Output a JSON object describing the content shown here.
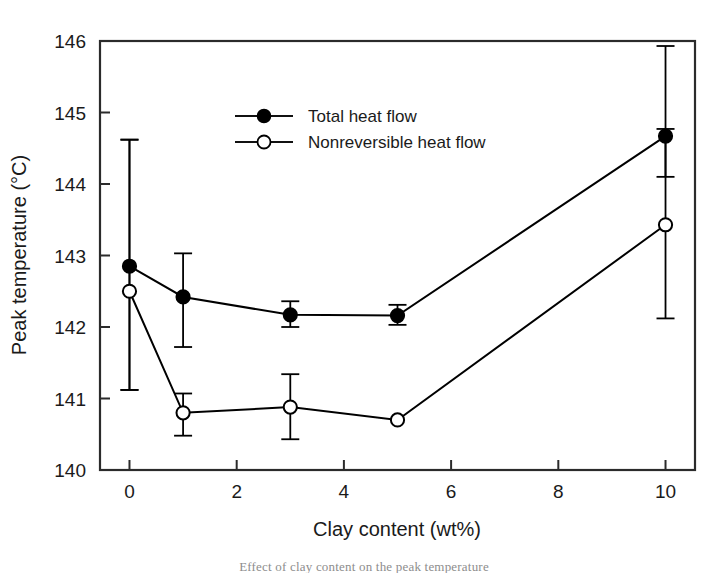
{
  "chart_data": {
    "type": "line",
    "title": "",
    "subtitle": "",
    "xlabel": "Clay content (wt%)",
    "ylabel": "Peak temperature (°C)",
    "xlim": [
      -0.55,
      10.55
    ],
    "ylim": [
      140,
      146
    ],
    "xticks": [
      0,
      2,
      4,
      6,
      8,
      10
    ],
    "xtick_labels": [
      "0",
      "2",
      "4",
      "6",
      "8",
      "10"
    ],
    "yticks": [
      140,
      141,
      142,
      143,
      144,
      145,
      146
    ],
    "ytick_labels": [
      "140",
      "141",
      "142",
      "143",
      "144",
      "145",
      "146"
    ],
    "grid": false,
    "legend_position": "upper-center-left",
    "x": [
      0,
      1,
      3,
      5,
      10
    ],
    "series": [
      {
        "name": "Total heat flow",
        "marker": "filled-circle",
        "color": "#000000",
        "values": [
          142.85,
          142.42,
          142.17,
          142.16,
          144.67
        ],
        "err_low": [
          141.12,
          141.72,
          142.0,
          142.03,
          144.1
        ],
        "err_high": [
          144.62,
          143.03,
          142.36,
          142.31,
          145.93
        ]
      },
      {
        "name": "Nonreversible heat flow",
        "marker": "open-circle",
        "color": "#000000",
        "values": [
          142.5,
          140.8,
          140.88,
          140.7,
          143.43
        ],
        "err_low": [
          141.12,
          140.48,
          140.43,
          140.7,
          142.12
        ],
        "err_high": [
          144.62,
          141.07,
          141.34,
          140.7,
          144.77
        ]
      }
    ]
  },
  "legend": {
    "entries": [
      {
        "label": "Total heat flow",
        "marker": "filled-circle"
      },
      {
        "label": "Nonreversible heat flow",
        "marker": "open-circle"
      }
    ]
  },
  "axes": {
    "x_title": "Clay content (wt%)",
    "y_title": "Peak temperature (°C)"
  },
  "caption": {
    "text": "Effect of clay content on the peak temperature"
  }
}
